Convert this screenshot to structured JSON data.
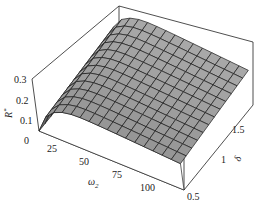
{
  "chart_data": {
    "type": "surface3d",
    "title": "",
    "zlabel": "R*",
    "xlabel": "ω2",
    "ylabel": "δ",
    "z_ticks": [
      "0",
      "0.1",
      "0.2",
      "0.3"
    ],
    "x_ticks": [
      "25",
      "50",
      "75",
      "100"
    ],
    "y_ticks": [
      "0.5",
      "1",
      "1.5"
    ],
    "xlim": [
      10,
      120
    ],
    "ylim": [
      0.5,
      2.0
    ],
    "zlim": [
      0,
      0.3
    ],
    "grid": false,
    "surface_color": "#9a9a9a",
    "mesh_color": "#1a1a1a",
    "x": [
      10,
      25,
      50,
      75,
      100,
      120
    ],
    "y": [
      0.5,
      1.0,
      1.5,
      2.0
    ],
    "z": [
      [
        0.0,
        0.15,
        0.19,
        0.18,
        0.16,
        0.14
      ],
      [
        0.0,
        0.17,
        0.21,
        0.2,
        0.18,
        0.16
      ],
      [
        0.0,
        0.19,
        0.23,
        0.22,
        0.2,
        0.18
      ],
      [
        0.0,
        0.2,
        0.25,
        0.24,
        0.22,
        0.2
      ]
    ]
  },
  "labels": {
    "z_axis": "R",
    "z_axis_sup": "*",
    "x_axis": "ω",
    "x_axis_sub": "2",
    "y_axis": "δ",
    "z_ticks": [
      "0",
      "0.1",
      "0.2",
      "0.3"
    ],
    "x_ticks": [
      "25",
      "50",
      "75",
      "100"
    ],
    "y_ticks": [
      "0.5",
      "1",
      "1.5"
    ]
  }
}
